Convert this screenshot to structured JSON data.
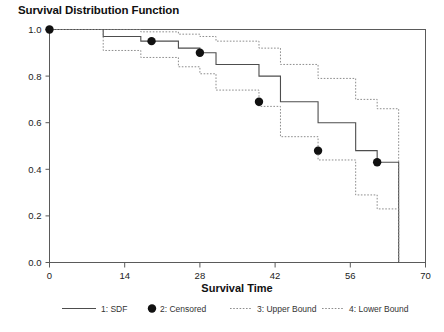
{
  "chart_data": {
    "type": "line",
    "title": "Survival Distribution Function",
    "xlabel": "Survival Time",
    "ylabel": "",
    "xlim": [
      0,
      70
    ],
    "ylim": [
      0.0,
      1.0
    ],
    "xticks": [
      0,
      14,
      28,
      42,
      56,
      70
    ],
    "xtick_labels": [
      "0",
      "14",
      "28",
      "42",
      "56",
      "70"
    ],
    "yticks": [
      0.0,
      0.2,
      0.4,
      0.6,
      0.8,
      1.0
    ],
    "ytick_labels": [
      "0.0",
      "0.2",
      "0.4",
      "0.6",
      "0.8",
      "1.0"
    ],
    "grid": false,
    "legend_position": "bottom",
    "series": [
      {
        "name": "1: SDF",
        "style": "solid",
        "color": "#4d4d4d",
        "step": "post",
        "x": [
          0,
          7,
          10,
          14,
          17,
          20,
          24,
          28,
          31,
          35,
          39,
          43,
          47,
          50,
          57,
          61,
          65
        ],
        "y": [
          1.0,
          1.0,
          0.97,
          0.97,
          0.95,
          0.95,
          0.92,
          0.9,
          0.85,
          0.85,
          0.8,
          0.69,
          0.69,
          0.6,
          0.48,
          0.43,
          0.0
        ]
      },
      {
        "name": "3: Upper Bound",
        "style": "dotted",
        "color": "#808080",
        "step": "post",
        "x": [
          0,
          7,
          10,
          14,
          17,
          20,
          24,
          28,
          31,
          35,
          39,
          43,
          47,
          50,
          57,
          61,
          65
        ],
        "y": [
          1.0,
          1.0,
          1.0,
          1.0,
          0.99,
          0.99,
          0.98,
          0.97,
          0.95,
          0.95,
          0.92,
          0.85,
          0.85,
          0.79,
          0.7,
          0.66,
          0.0
        ]
      },
      {
        "name": "4: Lower Bound",
        "style": "dotted",
        "color": "#808080",
        "step": "post",
        "x": [
          0,
          7,
          10,
          14,
          17,
          20,
          24,
          28,
          31,
          35,
          39,
          43,
          47,
          50,
          57,
          61,
          65
        ],
        "y": [
          1.0,
          1.0,
          0.91,
          0.91,
          0.88,
          0.88,
          0.84,
          0.81,
          0.74,
          0.74,
          0.67,
          0.54,
          0.54,
          0.44,
          0.29,
          0.23,
          0.0
        ]
      }
    ],
    "censored": {
      "name": "2: Censored",
      "marker": "filled-circle",
      "color": "#111111",
      "points": [
        {
          "x": 0,
          "y": 1.0
        },
        {
          "x": 19,
          "y": 0.95
        },
        {
          "x": 28,
          "y": 0.9
        },
        {
          "x": 39,
          "y": 0.69
        },
        {
          "x": 50,
          "y": 0.48
        },
        {
          "x": 61,
          "y": 0.43
        }
      ]
    },
    "legend": [
      {
        "id": 1,
        "label": "1: SDF",
        "style": "solid",
        "color": "#4d4d4d"
      },
      {
        "id": 2,
        "label": "2: Censored",
        "style": "marker",
        "color": "#111111"
      },
      {
        "id": 3,
        "label": "3: Upper Bound",
        "style": "dotted",
        "color": "#808080"
      },
      {
        "id": 4,
        "label": "4: Lower Bound",
        "style": "dotted",
        "color": "#808080"
      }
    ]
  }
}
